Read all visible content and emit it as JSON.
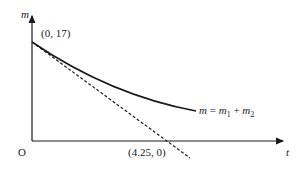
{
  "diagram": {
    "axes": {
      "y_label": "m",
      "x_label": "t",
      "origin_label": "O"
    },
    "points": {
      "y_intercept": "(0, 17)",
      "x_intercept": "(4.25, 0)"
    },
    "curve_label": {
      "lhs": "m",
      "eq": " = ",
      "m1": "m",
      "sub1": "1",
      "plus": " + ",
      "m2": "m",
      "sub2": "2"
    },
    "colors": {
      "line": "#1a1a1a",
      "background": "#ffffff"
    }
  }
}
